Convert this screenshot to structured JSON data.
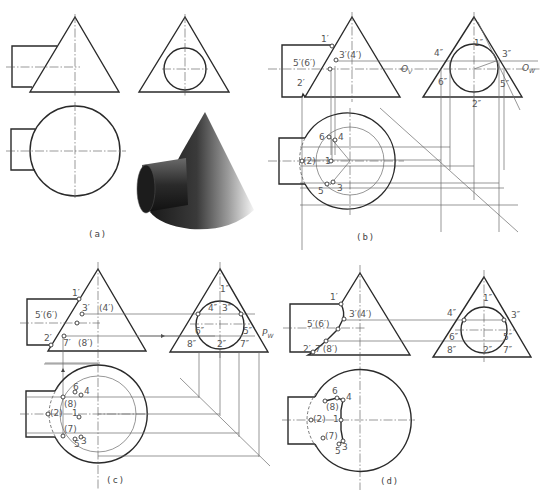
{
  "figure": {
    "panels": [
      {
        "id": "a",
        "caption": "(a)",
        "views": [
          "front",
          "side",
          "top",
          "pictorial"
        ]
      },
      {
        "id": "b",
        "caption": "(b)",
        "views": [
          "front",
          "side",
          "top"
        ],
        "aux_labels": [
          "O_V",
          "O_W"
        ]
      },
      {
        "id": "c",
        "caption": "(c)",
        "views": [
          "front",
          "side",
          "top"
        ],
        "aux_labels": [
          "P_W"
        ]
      },
      {
        "id": "d",
        "caption": "(d)",
        "views": [
          "front",
          "side",
          "top"
        ]
      }
    ]
  },
  "labels": {
    "b": {
      "front": [
        "1′",
        "3′(4′)",
        "5′(6′)",
        "2′"
      ],
      "side": [
        "4″",
        "1″",
        "3″",
        "6″",
        "5″",
        "2″"
      ],
      "top": [
        "6",
        "4",
        "(2)",
        "1",
        "5",
        "3"
      ],
      "ov": "O",
      "ov_sub": "V",
      "ow": "O",
      "ow_sub": "W"
    },
    "c": {
      "front": [
        "1′",
        "3′",
        "(4′)",
        "5′(6′)",
        "2′",
        "7′",
        "(8′)"
      ],
      "side": [
        "1″",
        "4″",
        "3″",
        "6″",
        "5″",
        "8″",
        "2″",
        "7″"
      ],
      "top": [
        "6",
        "4",
        "(8)",
        "(2)",
        "1",
        "(7)",
        "5",
        "3"
      ],
      "pw": "P",
      "pw_sub": "W"
    },
    "d": {
      "front": [
        "1′",
        "3′(4′)",
        "5′(6′)",
        "2′",
        "7′(8′)"
      ],
      "side": [
        "4″",
        "1″",
        "3″",
        "6″",
        "5″",
        "8″",
        "2″",
        "7″"
      ],
      "top": [
        "6",
        "4",
        "(8)",
        "(2)",
        "1",
        "(7)",
        "5",
        "3"
      ]
    }
  },
  "captions": {
    "a": "(a)",
    "b": "(b)",
    "c": "(c)",
    "d": "(d)"
  },
  "colors": {
    "line": "#2a2a2a",
    "thin": "#6a6a6a",
    "label": "#555555",
    "background": "#ffffff"
  }
}
